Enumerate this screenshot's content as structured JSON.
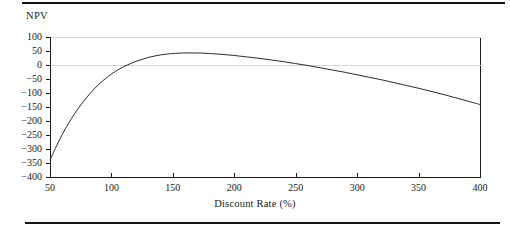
{
  "figure": {
    "npv_caption": "NPV",
    "x_axis_title": "Discount Rate (%)",
    "line_color": "#2b2b2b",
    "axis_color": "#1a1a1a",
    "grid_color": "#d6d6d6",
    "rule_color": "#151515"
  },
  "chart_data": {
    "type": "line",
    "title": "",
    "xlabel": "Discount Rate (%)",
    "ylabel": "NPV",
    "xlim": [
      50,
      400
    ],
    "ylim": [
      -400,
      100
    ],
    "grid": true,
    "legend": "none",
    "xticks": [
      50,
      100,
      150,
      200,
      250,
      300,
      350,
      400
    ],
    "xticklabels": [
      "50",
      "100",
      "150",
      "200",
      "250",
      "300",
      "350",
      "400"
    ],
    "yticks": [
      100,
      50,
      0,
      -50,
      -100,
      -150,
      -200,
      -250,
      -300,
      -350,
      -400
    ],
    "yticklabels": [
      "100",
      "50",
      "0",
      "-50",
      "-100",
      "-150",
      "-200",
      "-250",
      "-300",
      "-350",
      "-400"
    ],
    "gridlines_drawn_at": [
      100,
      0
    ],
    "series": [
      {
        "name": "NPV",
        "x": [
          50,
          55,
          60,
          65,
          70,
          75,
          80,
          85,
          90,
          95,
          100,
          105,
          110,
          115,
          120,
          125,
          130,
          135,
          140,
          145,
          150,
          160,
          170,
          180,
          190,
          200,
          210,
          220,
          230,
          240,
          250,
          260,
          270,
          280,
          290,
          300,
          310,
          320,
          330,
          340,
          350,
          360,
          370,
          380,
          390,
          400
        ],
        "y": [
          -340,
          -292,
          -248,
          -209,
          -174,
          -143,
          -115,
          -90,
          -68,
          -49,
          -32,
          -18,
          -6,
          4,
          13,
          20,
          27,
          32,
          36,
          39,
          41,
          43,
          43,
          41,
          38,
          34,
          29,
          24,
          18,
          12,
          5,
          -2,
          -10,
          -18,
          -26,
          -35,
          -44,
          -53,
          -63,
          -73,
          -83,
          -94,
          -105,
          -117,
          -129,
          -141
        ]
      }
    ],
    "annotations": {
      "peak_value": 43,
      "peak_discount_rate": 165,
      "first_zero_crossing": 113,
      "second_zero_crossing": 258,
      "start_value": -340,
      "end_value": -141
    }
  }
}
